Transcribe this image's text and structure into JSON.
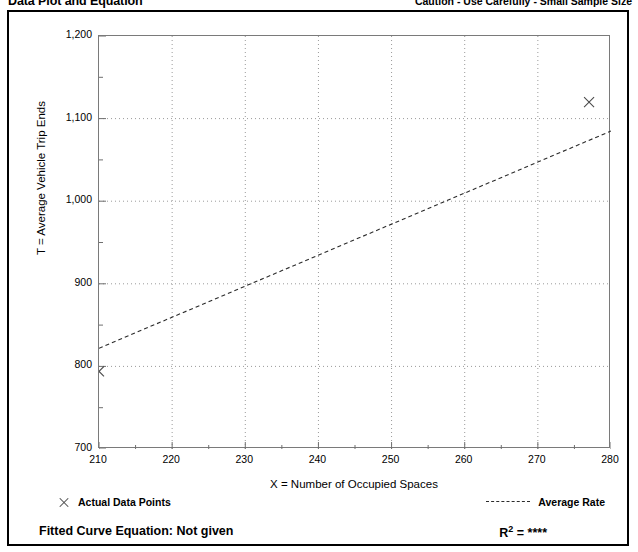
{
  "header": {
    "title": "Data Plot and Equation",
    "caution": "Caution - Use Carefully - Small Sample Size"
  },
  "legend": {
    "data_points_label": "Actual Data Points",
    "data_points_marker": "x-marker-icon",
    "average_rate_label": "Average Rate",
    "average_rate_marker": "dashed-line-icon"
  },
  "footer": {
    "fitted_curve_equation": "Fitted Curve Equation:  Not given",
    "r_squared_label": "R",
    "r_squared_exponent": "2",
    "r_squared_value": "= ****"
  },
  "chart_data": {
    "type": "scatter",
    "title": "Data Plot and Equation",
    "xlabel": "X = Number of Occupied Spaces",
    "ylabel": "T = Average Vehicle Trip Ends",
    "xlim": [
      210,
      280
    ],
    "ylim": [
      700,
      1200
    ],
    "xticks": [
      210,
      220,
      230,
      240,
      250,
      260,
      270,
      280
    ],
    "xtick_labels": [
      "210",
      "220",
      "230",
      "240",
      "250",
      "260",
      "270",
      "280"
    ],
    "x_minor_step": 5,
    "yticks": [
      700,
      800,
      900,
      1000,
      1100,
      1200
    ],
    "ytick_labels": [
      "700",
      "800",
      "900",
      "1,000",
      "1,100",
      "1,200"
    ],
    "y_minor_step": 50,
    "grid": "dotted-major-both-axes",
    "legend_position": "below-plot",
    "series": [
      {
        "name": "Actual Data Points",
        "type": "scatter",
        "marker": "x",
        "color": "#4a4a4a",
        "points": [
          {
            "x": 210,
            "y": 794
          },
          {
            "x": 277,
            "y": 1120
          }
        ]
      },
      {
        "name": "Average Rate",
        "type": "line",
        "style": "dashed",
        "color": "#2b2b2b",
        "points": [
          {
            "x": 210,
            "y": 822
          },
          {
            "x": 280,
            "y": 1085
          }
        ]
      }
    ]
  }
}
